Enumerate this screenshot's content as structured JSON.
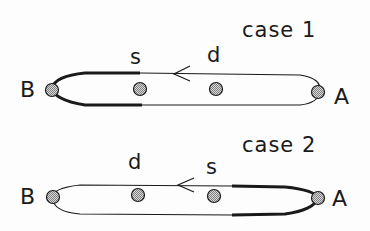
{
  "diagram": {
    "style": "hand-drawn sketch",
    "colors": {
      "stroke": "#1a1a1a",
      "node_fill": "#b0b0b0",
      "background": "#fdfdfd"
    },
    "cases": [
      {
        "title": "case 1",
        "endpoints": {
          "left": "B",
          "right": "A"
        },
        "points": [
          {
            "label": "s",
            "position": "left-middle"
          },
          {
            "label": "d",
            "position": "right-middle"
          }
        ],
        "arrow": "leftward, on top edge between s and d",
        "bold_segment": "loop around B from s"
      },
      {
        "title": "case 2",
        "endpoints": {
          "left": "B",
          "right": "A"
        },
        "points": [
          {
            "label": "d",
            "position": "left-middle"
          },
          {
            "label": "s",
            "position": "right-middle"
          }
        ],
        "arrow": "leftward, on top edge between d and s",
        "bold_segment": "loop around A from s"
      }
    ]
  }
}
